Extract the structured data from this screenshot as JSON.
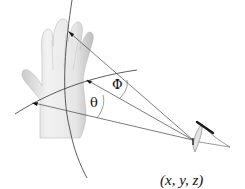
{
  "diagram": {
    "labels": {
      "theta": "θ",
      "phi": "Φ",
      "position": "(x, y, z)"
    },
    "elements": [
      "hand-model",
      "vertical-arc",
      "horizontal-arc",
      "ray-to-fingertip",
      "ray-to-palm-center",
      "ray-to-wrist",
      "sensor-device"
    ],
    "colors": {
      "line": "#333333",
      "hand_light": "#e8e8e8",
      "hand_shadow": "#b5b5b5",
      "sensor_stroke": "#1a1a1a"
    }
  }
}
